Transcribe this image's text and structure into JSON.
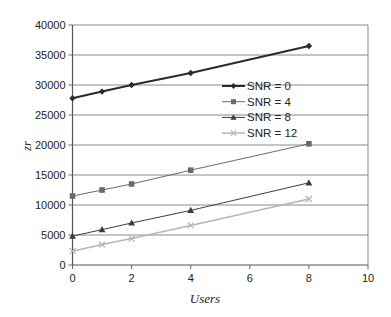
{
  "chart_data": {
    "type": "line",
    "title": "",
    "xlabel": "Users",
    "ylabel": "zr",
    "xlim": [
      0,
      10
    ],
    "ylim": [
      0,
      40000
    ],
    "xticks": [
      0,
      2,
      4,
      6,
      8,
      10
    ],
    "yticks": [
      0,
      5000,
      10000,
      15000,
      20000,
      25000,
      30000,
      35000,
      40000
    ],
    "grid": {
      "horizontal": true,
      "vertical": false
    },
    "legend_position": "inside-center-right",
    "x": [
      0,
      1,
      2,
      4,
      8
    ],
    "series": [
      {
        "name": "SNR = 0",
        "marker": "diamond",
        "color": "#2b2b2b",
        "line_width": 2,
        "values": [
          27800,
          28900,
          30000,
          32000,
          36500
        ]
      },
      {
        "name": "SNR = 4",
        "marker": "square",
        "color": "#6a6a6a",
        "line_width": 1,
        "values": [
          11500,
          12500,
          13500,
          15800,
          20200
        ]
      },
      {
        "name": "SNR = 8",
        "marker": "triangle",
        "color": "#3c3c3c",
        "line_width": 1,
        "values": [
          4800,
          5900,
          7000,
          9100,
          13700
        ]
      },
      {
        "name": "SNR = 12",
        "marker": "x",
        "color": "#b4b4b4",
        "line_width": 1.5,
        "values": [
          2300,
          3400,
          4400,
          6600,
          11000
        ]
      }
    ]
  }
}
